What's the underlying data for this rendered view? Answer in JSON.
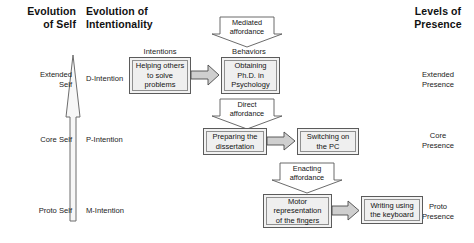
{
  "figure": {
    "type": "conceptual-flow-diagram",
    "background": "#ffffff",
    "box_fill": "#efefef",
    "box_stroke": "#5b5b5b",
    "arrow_fill": "#cfcfcf",
    "arrow_stroke": "#4a4a4a"
  },
  "headings": {
    "left": "Evolution\nof Self",
    "middle": "Evolution of\nIntentionality",
    "right": "Levels of\nPresence"
  },
  "tiers": [
    {
      "id": "extended",
      "self": "Extended\nSelf",
      "intention": "D-Intention",
      "presence": "Extended\nPresence"
    },
    {
      "id": "core",
      "self": "Core Self",
      "intention": "P-Intention",
      "presence": "Core\nPresence"
    },
    {
      "id": "proto",
      "self": "Proto Self",
      "intention": "M-Intention",
      "presence": "Proto\nPresence"
    }
  ],
  "captions": {
    "intentions": "Intentions",
    "behaviors": "Behaviors"
  },
  "affordances": [
    {
      "id": "mediated",
      "label": "Mediated\naffordance"
    },
    {
      "id": "direct",
      "label": "Direct\naffordance"
    },
    {
      "id": "enacting",
      "label": "Enacting\naffordance"
    }
  ],
  "rows": [
    {
      "id": "row-extended",
      "source": "Helping others\nto solve\nproblems",
      "target": "Obtaining\nPh.D. in\nPsychology"
    },
    {
      "id": "row-core",
      "source": "Preparing the\ndissertation",
      "target": "Switching on\nthe PC"
    },
    {
      "id": "row-proto",
      "source": "Motor\nrepresentation\nof the fingers",
      "target": "Writing using\nthe keyboard"
    }
  ],
  "evolution_arrow": {
    "name": "evolution-arrow",
    "direction": "upward"
  }
}
